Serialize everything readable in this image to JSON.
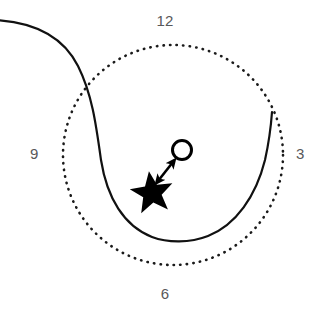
{
  "figure": {
    "background_color": "#ffffff",
    "width": 330,
    "height": 317
  },
  "clock_labels": {
    "top": "12",
    "right": "3",
    "bottom": "6",
    "left": "9",
    "color": "#58585a"
  },
  "elements": {
    "dotted_circle": {
      "name": "dotted-reference-circle",
      "center_x": 173,
      "center_y": 155,
      "radius": 110,
      "stroke": "#1a1a1a",
      "stroke_width": 2.4,
      "dash": "0.5 6"
    },
    "solid_curve": {
      "name": "solid-trajectory-curve",
      "stroke": "#111111",
      "stroke_width": 2.2,
      "description": "Solid curve entering from left edge, descending and forming a U through the lower interior, rising to the right rim"
    },
    "star_marker": {
      "name": "star-marker",
      "center_x": 152,
      "center_y": 192,
      "outer_radius": 22,
      "inner_radius": 9,
      "fill": "#000000"
    },
    "circle_marker": {
      "name": "open-circle-marker",
      "center_x": 182,
      "center_y": 150,
      "radius": 10,
      "stroke": "#000000",
      "stroke_width": 3,
      "fill": "none"
    },
    "arrow": {
      "name": "double-headed-arrow",
      "from_x": 157,
      "from_y": 180,
      "to_x": 174,
      "to_y": 161,
      "stroke": "#000000",
      "stroke_width": 2.6,
      "heads": "both"
    }
  }
}
